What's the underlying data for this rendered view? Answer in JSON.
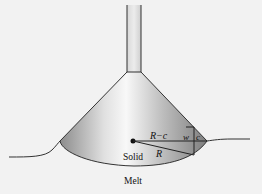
{
  "diagram": {
    "labels": {
      "r_minus_c": "R−c",
      "w": "w",
      "c": "c",
      "r": "R",
      "solid": "Solid",
      "melt": "Melt"
    },
    "colors": {
      "background": "#f2f2f2",
      "outline": "#222222",
      "solid_light": "#f4f4f4",
      "solid_dark": "#8a8a8a"
    }
  }
}
